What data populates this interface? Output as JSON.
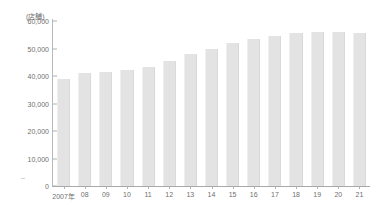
{
  "chart_data": {
    "type": "bar",
    "title": "",
    "subtitle": "",
    "unit_label": "(店舗)",
    "xlabel": "",
    "ylabel": "",
    "categories": [
      "2007年",
      "08",
      "09",
      "10",
      "11",
      "12",
      "13",
      "14",
      "15",
      "16",
      "17",
      "18",
      "19",
      "20",
      "21"
    ],
    "values": [
      39000,
      41000,
      41600,
      42300,
      43400,
      45600,
      48000,
      50000,
      52000,
      53500,
      54500,
      55500,
      56000,
      56000,
      55500
    ],
    "ylim": [
      0,
      60000
    ],
    "yticks": [
      0,
      10000,
      20000,
      30000,
      40000,
      50000,
      60000
    ],
    "ytick_labels": [
      "0",
      "10,000",
      "20,000",
      "30,000",
      "40,000",
      "50,000",
      "60,000"
    ],
    "grid": false,
    "legend": null,
    "bar_color": "#e3e3e3",
    "axis_color": "#b0b0b0",
    "text_color": "#6f6f6f"
  }
}
